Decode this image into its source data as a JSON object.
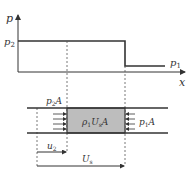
{
  "plot": {
    "y_axis_label": "p",
    "x_axis_label": "x",
    "level_high_label": "p",
    "level_high_sub": "2",
    "level_low_label": "p",
    "level_low_sub": "1"
  },
  "tube": {
    "left_force_label": "p",
    "left_force_sub": "2",
    "left_force_suffix": "A",
    "right_force_label": "p",
    "right_force_sub": "1",
    "right_force_suffix": "A",
    "box_label_a": "ρ",
    "box_label_a_sub": "1",
    "box_label_b": "U",
    "box_label_b_sub": "s",
    "box_label_c": "A"
  },
  "velocities": {
    "u2_label": "u",
    "u2_sub": "2",
    "us_label": "U",
    "us_sub": "s"
  },
  "colors": {
    "line": "#333333",
    "shade": "#bdbdbd",
    "dash": "#555555"
  }
}
